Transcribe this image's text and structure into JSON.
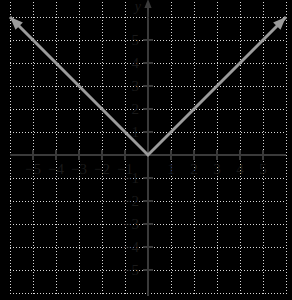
{
  "figure": {
    "kind": "cartesian-coordinate-plane",
    "background_color": "#ffffff",
    "width": 292,
    "height": 300
  },
  "colors": {
    "axis": "#3a3a3a",
    "grid": "#d8d8d8",
    "curve": "#9b9b9b",
    "label": "#1a1a1a"
  },
  "axes": {
    "x_label": "",
    "y_label": "y",
    "origin_px": {
      "x": 148,
      "y": 155
    },
    "unit_px": 23,
    "xlim": [
      -6.0,
      6.0
    ],
    "ylim": [
      -6.3,
      6.7
    ],
    "x_tick_values": [
      -5,
      -4,
      -3,
      -2,
      -1,
      1,
      2,
      3,
      4,
      5
    ],
    "x_tick_labels": [
      "-5",
      "-4",
      "-3",
      "-2",
      "-1",
      "1",
      "2",
      "3",
      "4",
      "5"
    ],
    "y_tick_values": [
      5,
      4,
      3,
      2,
      1,
      -1,
      -2,
      -3,
      -4,
      -5
    ],
    "y_tick_labels": [
      "5",
      "4",
      "3",
      "2",
      "1",
      "-1",
      "-2",
      "-3",
      "-4",
      "-5"
    ],
    "grid": true,
    "grid_style": "dotted",
    "tick_length_px": 5,
    "x_axis_extent_px": [
      10,
      286
    ],
    "y_axis_extent_px": [
      2,
      296
    ]
  },
  "chart_data": {
    "type": "line",
    "title": "",
    "xlabel": "",
    "ylabel": "y",
    "xlim": [
      -6.0,
      6.0
    ],
    "ylim": [
      -6.3,
      6.7
    ],
    "grid": true,
    "legend": null,
    "annotations": [],
    "series": [
      {
        "name": "y = |x|",
        "description": "absolute value V-shape with vertex at the origin, slope -1 on the left branch and slope +1 on the right branch",
        "color": "#9b9b9b",
        "arrow_start": true,
        "arrow_end": true,
        "x": [
          -6.0,
          0,
          6.0
        ],
        "y": [
          6.0,
          0,
          6.0
        ],
        "points": [
          {
            "x": -6.0,
            "y": 6.0
          },
          {
            "x": -5,
            "y": 5
          },
          {
            "x": -4,
            "y": 4
          },
          {
            "x": -3,
            "y": 3
          },
          {
            "x": -2,
            "y": 2
          },
          {
            "x": -1,
            "y": 1
          },
          {
            "x": 0,
            "y": 0
          },
          {
            "x": 1,
            "y": 1
          },
          {
            "x": 2,
            "y": 2
          },
          {
            "x": 3,
            "y": 3
          },
          {
            "x": 4,
            "y": 4
          },
          {
            "x": 5,
            "y": 5
          },
          {
            "x": 6.0,
            "y": 6.0
          }
        ]
      }
    ]
  }
}
